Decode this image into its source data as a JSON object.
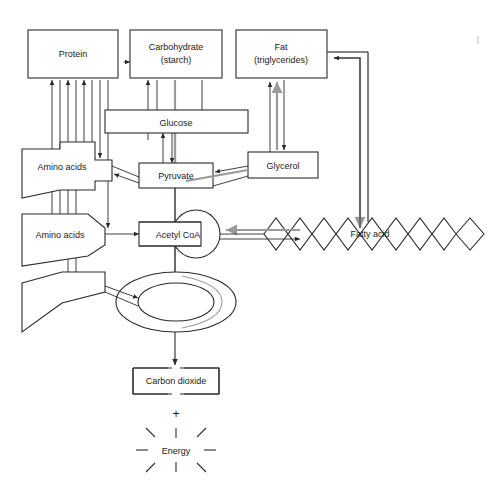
{
  "diagram": {
    "nodes": {
      "protein": "Protein",
      "carbohydrate_line1": "Carbohydrate",
      "carbohydrate_line2": "(starch)",
      "fat_line1": "Fat",
      "fat_line2": "(triglycerides)",
      "glucose": "Glucose",
      "amino_acids_upper": "Amino acids",
      "amino_acids_lower": "Amino acids",
      "pyruvate": "Pyruvate",
      "glycerol": "Glycerol",
      "acetyl_coa": "Acetyl  CoA",
      "fatty_acid": "Fatty acid",
      "carbon_dioxide": "Carbon dioxide",
      "plus": "+",
      "energy": "Energy"
    },
    "colors": {
      "stroke": "#2b2b2b",
      "gray_arrow": "#9a9a9a",
      "background": "#ffffff",
      "text": "#1a1a1a"
    }
  }
}
